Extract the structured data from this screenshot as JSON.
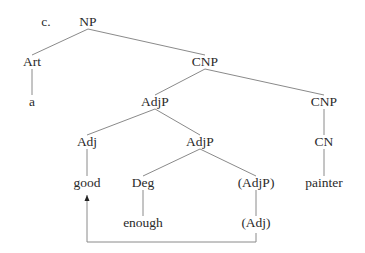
{
  "diagram": {
    "example_label": "c.",
    "line_color": "#8a8a8a",
    "text_color": "#2a2a2a",
    "nodes": [
      {
        "id": "np",
        "label": "NP",
        "x": 88,
        "y": 22
      },
      {
        "id": "art",
        "label": "Art",
        "x": 32,
        "y": 62
      },
      {
        "id": "a",
        "label": "a",
        "x": 32,
        "y": 102
      },
      {
        "id": "cnp1",
        "label": "CNP",
        "x": 205,
        "y": 62
      },
      {
        "id": "adjp1",
        "label": "AdjP",
        "x": 155,
        "y": 102
      },
      {
        "id": "cnp2",
        "label": "CNP",
        "x": 324,
        "y": 102
      },
      {
        "id": "adj1",
        "label": "Adj",
        "x": 87,
        "y": 142
      },
      {
        "id": "adjp2",
        "label": "AdjP",
        "x": 200,
        "y": 142
      },
      {
        "id": "cn",
        "label": "CN",
        "x": 324,
        "y": 142
      },
      {
        "id": "good",
        "label": "good",
        "x": 87,
        "y": 183
      },
      {
        "id": "deg",
        "label": "Deg",
        "x": 143,
        "y": 183
      },
      {
        "id": "adjp3",
        "label": "(AdjP)",
        "x": 256,
        "y": 183
      },
      {
        "id": "painter",
        "label": "painter",
        "x": 324,
        "y": 183
      },
      {
        "id": "enough",
        "label": "enough",
        "x": 143,
        "y": 223
      },
      {
        "id": "adj2",
        "label": "(Adj)",
        "x": 256,
        "y": 223
      }
    ],
    "edges": [
      [
        "np",
        "art"
      ],
      [
        "np",
        "cnp1"
      ],
      [
        "art",
        "a"
      ],
      [
        "cnp1",
        "adjp1"
      ],
      [
        "cnp1",
        "cnp2"
      ],
      [
        "adjp1",
        "adj1"
      ],
      [
        "adjp1",
        "adjp2"
      ],
      [
        "cnp2",
        "cn"
      ],
      [
        "adj1",
        "good"
      ],
      [
        "adjp2",
        "deg"
      ],
      [
        "adjp2",
        "adjp3"
      ],
      [
        "cn",
        "painter"
      ],
      [
        "deg",
        "enough"
      ],
      [
        "adjp3",
        "adj2"
      ]
    ],
    "movement_arrow": {
      "from": "(Adj)",
      "to": "good",
      "path": [
        [
          256,
          233
        ],
        [
          256,
          242
        ],
        [
          87,
          242
        ],
        [
          87,
          195
        ]
      ]
    }
  }
}
